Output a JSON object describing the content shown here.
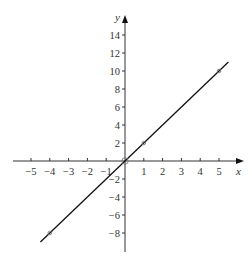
{
  "chart_data": {
    "type": "line",
    "title": "",
    "xlabel": "x",
    "ylabel": "y",
    "xlim": [
      -5.8,
      6
    ],
    "ylim": [
      -10.5,
      16
    ],
    "grid": false,
    "legend": null,
    "x_ticks": [
      -5,
      -4,
      -3,
      -2,
      -1,
      1,
      2,
      3,
      4,
      5
    ],
    "x_tick_labels": [
      "−5",
      "−4",
      "−3",
      "−2",
      "−1",
      "1",
      "2",
      "3",
      "4",
      "5"
    ],
    "y_ticks": [
      -8,
      -6,
      -4,
      -2,
      2,
      4,
      6,
      8,
      10,
      12,
      14
    ],
    "y_tick_labels": [
      "−8",
      "−6",
      "−4",
      "−2",
      "2",
      "4",
      "6",
      "8",
      "10",
      "12",
      "14"
    ],
    "origin_label": "0",
    "series": [
      {
        "name": "y = 2x",
        "equation": "y = 2x",
        "line_x_range": [
          -4.5,
          5.5
        ],
        "x": [
          -4.5,
          5.5
        ],
        "y": [
          -9,
          11
        ],
        "color": "#111111"
      }
    ],
    "marked_points": [
      {
        "x": -4,
        "y": -8
      },
      {
        "x": 0,
        "y": 0
      },
      {
        "x": 1,
        "y": 2
      },
      {
        "x": 5,
        "y": 10
      }
    ]
  },
  "axes": {
    "x_label": "x",
    "y_label": "y",
    "color": "#333333"
  }
}
